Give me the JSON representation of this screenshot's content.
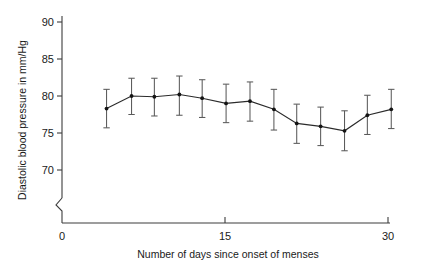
{
  "chart_data": {
    "type": "line",
    "title": "",
    "subtitle": "",
    "xlabel": "Number of days since onset of menses",
    "ylabel": "Diastolic blood pressure in mm/Hg",
    "xlim": [
      0,
      30
    ],
    "ylim": [
      68.5,
      90
    ],
    "y_axis_break": true,
    "y_break_from": 0,
    "y_break_to": 68.5,
    "grid": false,
    "legend": null,
    "xticks": [
      0,
      15,
      30
    ],
    "xticklabels": [
      "0",
      "15",
      "30"
    ],
    "yticks": [
      70,
      75,
      80,
      85,
      90
    ],
    "yticklabels": [
      "70",
      "75",
      "80",
      "85",
      "90"
    ],
    "zero_tick_label": "0",
    "marker": "filled-circle",
    "error_bar_style": "capped-vertical",
    "error_type": "standard deviation",
    "x": [
      4.1,
      6.4,
      8.5,
      10.8,
      12.9,
      15.1,
      17.3,
      19.5,
      21.6,
      23.8,
      26.0,
      28.1,
      30.3
    ],
    "y": [
      78.3,
      80.0,
      79.9,
      80.2,
      79.7,
      79.0,
      79.3,
      78.2,
      76.3,
      75.9,
      75.3,
      77.4,
      78.2
    ],
    "yerr_lower": [
      75.7,
      77.5,
      77.3,
      77.4,
      77.1,
      76.4,
      76.6,
      75.4,
      73.6,
      73.3,
      72.6,
      74.8,
      75.6
    ],
    "yerr_upper": [
      80.9,
      82.4,
      82.4,
      82.7,
      82.2,
      81.6,
      81.9,
      80.9,
      78.9,
      78.5,
      78.0,
      80.1,
      80.9
    ],
    "series": [
      {
        "name": "Diastolic blood pressure",
        "values": [
          78.3,
          80.0,
          79.9,
          80.2,
          79.7,
          79.0,
          79.3,
          78.2,
          76.3,
          75.9,
          75.3,
          77.4,
          78.2
        ]
      }
    ]
  },
  "figure": {
    "axis_color": "#3c3c3c",
    "line_color": "#2b2b2b",
    "marker_color": "#141414",
    "error_color": "#5a5a5a",
    "background": "#ffffff"
  }
}
